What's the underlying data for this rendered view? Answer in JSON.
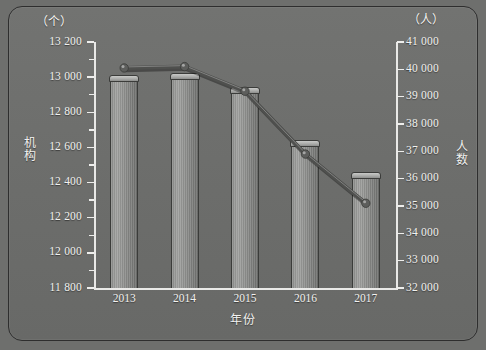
{
  "chart_data": {
    "type": "bar",
    "title": "",
    "xlabel": "年份",
    "categories": [
      "2013",
      "2014",
      "2015",
      "2016",
      "2017"
    ],
    "grid": false,
    "legend": "none",
    "series": [
      {
        "name": "机构",
        "chart_type": "bar",
        "axis": "left",
        "unit": "个",
        "values": [
          13000,
          13010,
          12930,
          12630,
          12450
        ]
      },
      {
        "name": "人数",
        "chart_type": "line",
        "axis": "right",
        "unit": "人",
        "values": [
          40050,
          40100,
          39200,
          36900,
          35100
        ]
      }
    ],
    "left_axis": {
      "label": "机构",
      "unit": "（个）",
      "ylim": [
        11800,
        13200
      ],
      "step": 200,
      "ticks": [
        "13 200",
        "13 000",
        "12 800",
        "12 600",
        "12 400",
        "12 200",
        "12 000",
        "11 800"
      ]
    },
    "right_axis": {
      "label": "人数",
      "unit": "（人）",
      "ylim": [
        32000,
        41000
      ],
      "step": 1000,
      "ticks": [
        "41 000",
        "40 000",
        "39 000",
        "38 000",
        "37 000",
        "36 000",
        "35 000",
        "34 000",
        "33 000",
        "32 000"
      ]
    },
    "colors": {
      "background": "#6e6f6d",
      "axis": "#e9e9e7",
      "text": "#f2f2f0",
      "bar": "#9a9b99",
      "line": "#5a5b59",
      "frame_border": "#2e2e2e"
    }
  }
}
